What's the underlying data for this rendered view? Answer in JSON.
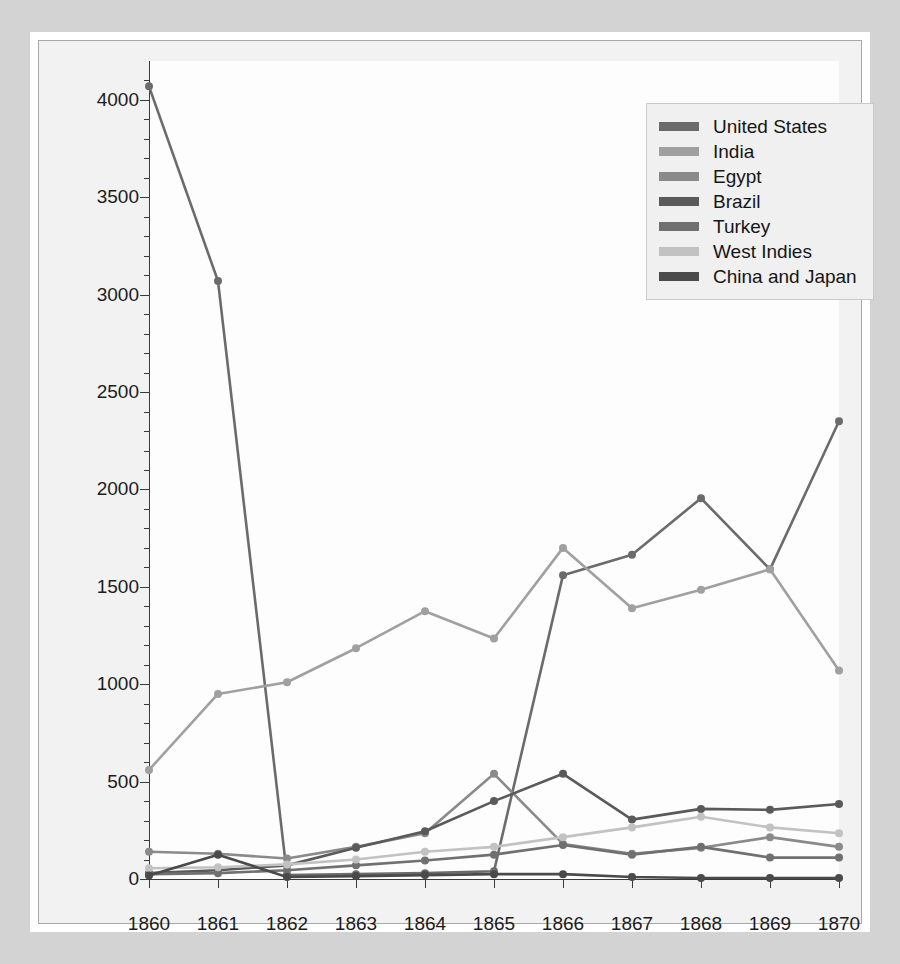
{
  "chart_data": {
    "type": "line",
    "title": "",
    "subtitle": "",
    "xlabel": "",
    "ylabel": "Cotton imports per thousand 400-pound bales",
    "x": [
      1860,
      1861,
      1862,
      1863,
      1864,
      1865,
      1866,
      1867,
      1868,
      1869,
      1870
    ],
    "xticklabels": [
      "1860",
      "1861",
      "1862",
      "1863",
      "1864",
      "1865",
      "1866",
      "1867",
      "1868",
      "1869",
      "1870"
    ],
    "yticklabels": [
      "0",
      "500",
      "1000",
      "1500",
      "2000",
      "2500",
      "3000",
      "3500",
      "4000"
    ],
    "ytickvalues": [
      0,
      500,
      1000,
      1500,
      2000,
      2500,
      3000,
      3500,
      4000
    ],
    "xlim": [
      1860,
      1870
    ],
    "ylim": [
      0,
      4200
    ],
    "grid": false,
    "minor_ticks": true,
    "legend_position": "top-right",
    "series": [
      {
        "name": "United States",
        "color": "#6b6b6b",
        "values": [
          4070,
          3070,
          15,
          20,
          25,
          35,
          1560,
          1665,
          1955,
          1590,
          2350
        ]
      },
      {
        "name": "India",
        "color": "#a0a0a0",
        "values": [
          560,
          950,
          1010,
          1185,
          1375,
          1235,
          1700,
          1390,
          1485,
          1590,
          1070
        ]
      },
      {
        "name": "Egypt",
        "color": "#8a8a8a",
        "values": [
          140,
          130,
          105,
          165,
          235,
          540,
          180,
          130,
          160,
          215,
          165
        ]
      },
      {
        "name": "Brazil",
        "color": "#5a5a5a",
        "values": [
          30,
          45,
          70,
          160,
          245,
          400,
          540,
          0,
          0,
          0,
          0
        ]
      },
      {
        "name": "Turkey",
        "color": "#707070",
        "values": [
          25,
          30,
          45,
          70,
          95,
          125,
          175,
          125,
          165,
          110,
          110
        ]
      },
      {
        "name": "West Indies",
        "color": "#c2c2c2",
        "values": [
          55,
          60,
          75,
          100,
          140,
          165,
          215,
          265,
          320,
          265,
          235
        ]
      },
      {
        "name": "China and Japan",
        "color": "#4a4a4a",
        "values": [
          18,
          60,
          20,
          305,
          425,
          540,
          45,
          10,
          0,
          0,
          0
        ]
      }
    ],
    "series_render": [
      {
        "name": "United States",
        "color": "#6b6b6b",
        "points": [
          [
            1860,
            4070
          ],
          [
            1861,
            3070
          ],
          [
            1862,
            20
          ],
          [
            1863,
            25
          ],
          [
            1864,
            30
          ],
          [
            1865,
            40
          ],
          [
            1866,
            1560
          ],
          [
            1867,
            1665
          ],
          [
            1868,
            1955
          ],
          [
            1869,
            1590
          ],
          [
            1870,
            2350
          ]
        ]
      },
      {
        "name": "India",
        "color": "#a0a0a0",
        "points": [
          [
            1860,
            560
          ],
          [
            1861,
            950
          ],
          [
            1862,
            1010
          ],
          [
            1863,
            1185
          ],
          [
            1864,
            1375
          ],
          [
            1865,
            1235
          ],
          [
            1866,
            1700
          ],
          [
            1867,
            1390
          ],
          [
            1868,
            1485
          ],
          [
            1869,
            1590
          ],
          [
            1870,
            1070
          ]
        ]
      },
      {
        "name": "Egypt",
        "color": "#8a8a8a",
        "points": [
          [
            1860,
            140
          ],
          [
            1861,
            130
          ],
          [
            1862,
            105
          ],
          [
            1863,
            165
          ],
          [
            1864,
            235
          ],
          [
            1865,
            540
          ],
          [
            1866,
            180
          ],
          [
            1867,
            130
          ],
          [
            1868,
            160
          ],
          [
            1869,
            215
          ],
          [
            1870,
            165
          ]
        ]
      },
      {
        "name": "Brazil",
        "color": "#5a5a5a",
        "points": [
          [
            1860,
            30
          ],
          [
            1861,
            45
          ],
          [
            1862,
            70
          ],
          [
            1863,
            160
          ],
          [
            1864,
            245
          ],
          [
            1865,
            400
          ],
          [
            1866,
            540
          ],
          [
            1867,
            305
          ],
          [
            1868,
            360
          ],
          [
            1869,
            355
          ],
          [
            1870,
            385
          ]
        ]
      },
      {
        "name": "Turkey",
        "color": "#707070",
        "points": [
          [
            1860,
            25
          ],
          [
            1861,
            30
          ],
          [
            1862,
            45
          ],
          [
            1863,
            70
          ],
          [
            1864,
            95
          ],
          [
            1865,
            125
          ],
          [
            1866,
            175
          ],
          [
            1867,
            125
          ],
          [
            1868,
            165
          ],
          [
            1869,
            110
          ],
          [
            1870,
            110
          ]
        ]
      },
      {
        "name": "West Indies",
        "color": "#c2c2c2",
        "points": [
          [
            1860,
            55
          ],
          [
            1861,
            60
          ],
          [
            1862,
            75
          ],
          [
            1863,
            100
          ],
          [
            1864,
            140
          ],
          [
            1865,
            165
          ],
          [
            1866,
            215
          ],
          [
            1867,
            265
          ],
          [
            1868,
            320
          ],
          [
            1869,
            265
          ],
          [
            1870,
            235
          ]
        ]
      },
      {
        "name": "China and Japan",
        "color": "#4a4a4a",
        "points": [
          [
            1860,
            18
          ],
          [
            1861,
            125
          ],
          [
            1862,
            10
          ],
          [
            1863,
            15
          ],
          [
            1864,
            20
          ],
          [
            1865,
            25
          ],
          [
            1866,
            25
          ],
          [
            1867,
            10
          ],
          [
            1868,
            5
          ],
          [
            1869,
            5
          ],
          [
            1870,
            5
          ]
        ]
      }
    ]
  },
  "legend": {
    "items": [
      {
        "label": "United States",
        "color": "#6b6b6b"
      },
      {
        "label": "India",
        "color": "#a0a0a0"
      },
      {
        "label": "Egypt",
        "color": "#8a8a8a"
      },
      {
        "label": "Brazil",
        "color": "#5a5a5a"
      },
      {
        "label": "Turkey",
        "color": "#707070"
      },
      {
        "label": "West Indies",
        "color": "#c2c2c2"
      },
      {
        "label": "China and Japan",
        "color": "#4a4a4a"
      }
    ]
  }
}
